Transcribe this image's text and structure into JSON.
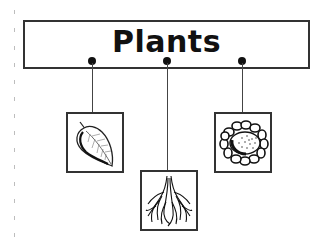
{
  "diagram": {
    "title": "Plants",
    "type": "hierarchy",
    "root": {
      "label": "Plants"
    },
    "children": [
      {
        "id": "leaf",
        "label": "Leaf",
        "icon": "leaf-icon",
        "position": "left"
      },
      {
        "id": "root",
        "label": "Root",
        "icon": "roots-icon",
        "position": "center-lower"
      },
      {
        "id": "flower",
        "label": "Flower",
        "icon": "flower-icon",
        "position": "right"
      }
    ],
    "colors": {
      "stroke": "#333333",
      "text": "#111111",
      "background": "#ffffff"
    }
  }
}
